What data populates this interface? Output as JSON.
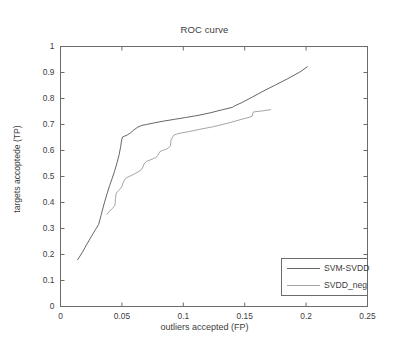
{
  "chart_data": {
    "type": "line",
    "title": "ROC curve",
    "xlabel": "outliers accepted (FP)",
    "ylabel": "targets accoptede (TP)",
    "xlim": [
      0,
      0.25
    ],
    "ylim": [
      0,
      1
    ],
    "xticks": [
      "0",
      "0.05",
      "0.1",
      "0.15",
      "0.2",
      "0.25"
    ],
    "xtick_values": [
      0,
      0.05,
      0.1,
      0.15,
      0.2,
      0.25
    ],
    "yticks": [
      "0",
      "0.1",
      "0.2",
      "0.3",
      "0.4",
      "0.5",
      "0.6",
      "0.7",
      "0.8",
      "0.9",
      "1"
    ],
    "ytick_values": [
      0,
      0.1,
      0.2,
      0.3,
      0.4,
      0.5,
      0.6,
      0.7,
      0.8,
      0.9,
      1
    ],
    "grid": false,
    "legend_position": "lower right",
    "series": [
      {
        "name": "SVM-SVDD",
        "color": "#555555",
        "style": "solid",
        "x": [
          0.014,
          0.018,
          0.0215,
          0.025,
          0.0285,
          0.031,
          0.033,
          0.0355,
          0.038,
          0.04,
          0.042,
          0.044,
          0.046,
          0.0478,
          0.049,
          0.0498,
          0.0505,
          0.052,
          0.0545,
          0.057,
          0.06,
          0.063,
          0.0665,
          0.07,
          0.076,
          0.084,
          0.093,
          0.102,
          0.112,
          0.122,
          0.132,
          0.14,
          0.142,
          0.148,
          0.156,
          0.165,
          0.175,
          0.185,
          0.195,
          0.201
        ],
        "y": [
          0.18,
          0.21,
          0.24,
          0.268,
          0.296,
          0.315,
          0.35,
          0.395,
          0.435,
          0.465,
          0.492,
          0.52,
          0.552,
          0.585,
          0.615,
          0.64,
          0.652,
          0.655,
          0.66,
          0.668,
          0.68,
          0.69,
          0.697,
          0.7,
          0.706,
          0.713,
          0.72,
          0.727,
          0.735,
          0.745,
          0.757,
          0.766,
          0.772,
          0.785,
          0.805,
          0.828,
          0.852,
          0.876,
          0.902,
          0.922
        ]
      },
      {
        "name": "SVDD_neg",
        "color": "#9a9a9a",
        "style": "solid",
        "x": [
          0.038,
          0.04,
          0.0412,
          0.0425,
          0.043,
          0.044,
          0.0445,
          0.0448,
          0.0452,
          0.046,
          0.047,
          0.048,
          0.0492,
          0.05,
          0.0512,
          0.0525,
          0.054,
          0.056,
          0.0585,
          0.061,
          0.064,
          0.0665,
          0.068,
          0.07,
          0.072,
          0.0745,
          0.076,
          0.0775,
          0.079,
          0.081,
          0.083,
          0.085,
          0.0865,
          0.088,
          0.0895,
          0.09,
          0.092,
          0.095,
          0.099,
          0.104,
          0.11,
          0.116,
          0.123,
          0.13,
          0.137,
          0.143,
          0.149,
          0.154,
          0.156,
          0.157,
          0.16,
          0.164,
          0.168,
          0.171
        ],
        "y": [
          0.355,
          0.368,
          0.372,
          0.378,
          0.382,
          0.386,
          0.395,
          0.415,
          0.432,
          0.44,
          0.444,
          0.45,
          0.456,
          0.462,
          0.478,
          0.49,
          0.496,
          0.5,
          0.506,
          0.512,
          0.52,
          0.53,
          0.548,
          0.558,
          0.562,
          0.566,
          0.57,
          0.572,
          0.58,
          0.596,
          0.6,
          0.603,
          0.606,
          0.61,
          0.618,
          0.64,
          0.658,
          0.664,
          0.668,
          0.672,
          0.678,
          0.684,
          0.69,
          0.698,
          0.706,
          0.714,
          0.722,
          0.728,
          0.732,
          0.748,
          0.75,
          0.752,
          0.755,
          0.757
        ]
      }
    ]
  },
  "legend": {
    "items": [
      {
        "label": "SVM-SVDD"
      },
      {
        "label": "SVDD_neg"
      }
    ]
  },
  "axes": {
    "color": "#6b6b6b"
  }
}
